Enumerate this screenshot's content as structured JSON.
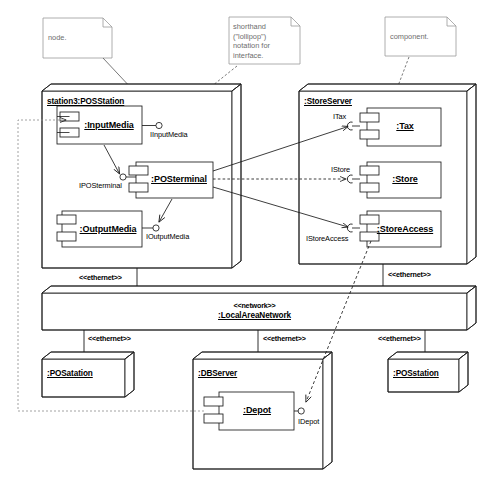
{
  "diagram": {
    "bg_color": "#ffffff",
    "line_color": "#1a1a1a",
    "note_text_color": "#6d6d6d"
  },
  "notes": [
    {
      "id": "note-node",
      "text": "node."
    },
    {
      "id": "note-lollipop",
      "text": "shorthand\n(\"lollipop\")\nnotation for\ninterface."
    },
    {
      "id": "note-component",
      "text": "component."
    }
  ],
  "nodes": [
    {
      "id": "node-posstation3",
      "name": "station3:POSStation",
      "stereotype": ""
    },
    {
      "id": "node-storeserver",
      "name": ":StoreServer",
      "stereotype": ""
    },
    {
      "id": "node-lan",
      "name": ":LocalAreaNetwork",
      "stereotype": "<<network>>"
    },
    {
      "id": "node-posatation",
      "name": ":POSatation",
      "stereotype": ""
    },
    {
      "id": "node-dbserver",
      "name": ":DBServer",
      "stereotype": ""
    },
    {
      "id": "node-posstation",
      "name": ":POSstation",
      "stereotype": ""
    }
  ],
  "components": [
    {
      "id": "comp-inputmedia",
      "name": ":InputMedia",
      "parent": "node-posstation3"
    },
    {
      "id": "comp-posterminal",
      "name": ":POSterminal",
      "parent": "node-posstation3"
    },
    {
      "id": "comp-outputmedia",
      "name": ":OutputMedia",
      "parent": "node-posstation3"
    },
    {
      "id": "comp-tax",
      "name": ":Tax",
      "parent": "node-storeserver"
    },
    {
      "id": "comp-store",
      "name": ":Store",
      "parent": "node-storeserver"
    },
    {
      "id": "comp-storeaccess",
      "name": ":StoreAccess",
      "parent": "node-storeserver"
    },
    {
      "id": "comp-depot",
      "name": ":Depot",
      "parent": "node-dbserver"
    }
  ],
  "interfaces": [
    {
      "id": "iface-iinputmedia",
      "name": "IInputMedia",
      "kind": "provided"
    },
    {
      "id": "iface-iposterminal",
      "name": "IPOSterminal",
      "kind": "provided"
    },
    {
      "id": "iface-ioutputmedia",
      "name": "IOutputMedia",
      "kind": "provided"
    },
    {
      "id": "iface-itax",
      "name": "ITax",
      "kind": "required"
    },
    {
      "id": "iface-istore",
      "name": "IStore",
      "kind": "required"
    },
    {
      "id": "iface-istoreaccess",
      "name": "IStoreAccess",
      "kind": "required"
    },
    {
      "id": "iface-idepot",
      "name": "IDepot",
      "kind": "provided"
    }
  ],
  "links": [
    {
      "id": "link-posstation3-lan",
      "stereotype": "<<ethernet>>"
    },
    {
      "id": "link-storeserver-lan",
      "stereotype": "<<ethernet>>"
    },
    {
      "id": "link-lan-posatation",
      "stereotype": "<<ethernet>>"
    },
    {
      "id": "link-lan-dbserver",
      "stereotype": "<<ethernet>>"
    },
    {
      "id": "link-lan-posstation",
      "stereotype": "<<ethernet>>"
    }
  ]
}
